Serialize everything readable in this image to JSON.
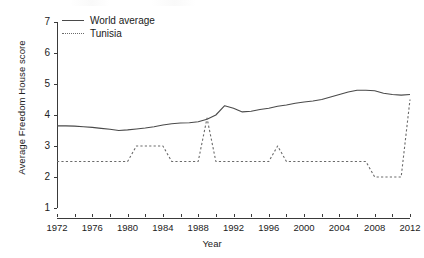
{
  "chart_data": {
    "type": "line",
    "title": "",
    "xlabel": "Year",
    "ylabel": "Average Freedom House score",
    "xlim": [
      1972,
      2012
    ],
    "ylim": [
      1,
      7
    ],
    "grid": false,
    "legend_position": "top-left",
    "x_tick_labels": [
      "1972",
      "1976",
      "1980",
      "1984",
      "1988",
      "1992",
      "1996",
      "2000",
      "2004",
      "2008",
      "2012"
    ],
    "x_tick_values": [
      1972,
      1976,
      1980,
      1984,
      1988,
      1992,
      1996,
      2000,
      2004,
      2008,
      2012
    ],
    "x_minor_tick_values": [
      1974,
      1978,
      1982,
      1986,
      1990,
      1994,
      1998,
      2002,
      2006,
      2010
    ],
    "y_tick_labels": [
      "1",
      "2",
      "3",
      "4",
      "5",
      "6",
      "7"
    ],
    "y_tick_values": [
      1,
      2,
      3,
      4,
      5,
      6,
      7
    ],
    "x": [
      1972,
      1973,
      1974,
      1975,
      1976,
      1977,
      1978,
      1979,
      1980,
      1981,
      1982,
      1983,
      1984,
      1985,
      1986,
      1987,
      1988,
      1989,
      1990,
      1991,
      1992,
      1993,
      1994,
      1995,
      1996,
      1997,
      1998,
      1999,
      2000,
      2001,
      2002,
      2003,
      2004,
      2005,
      2006,
      2007,
      2008,
      2009,
      2010,
      2011,
      2012
    ],
    "series": [
      {
        "name": "World average",
        "style": "solid",
        "color": "#4a4a4a",
        "values": [
          3.65,
          3.65,
          3.64,
          3.62,
          3.6,
          3.57,
          3.54,
          3.5,
          3.52,
          3.55,
          3.58,
          3.62,
          3.68,
          3.72,
          3.74,
          3.75,
          3.78,
          3.86,
          4.0,
          4.3,
          4.22,
          4.1,
          4.12,
          4.18,
          4.22,
          4.28,
          4.32,
          4.38,
          4.42,
          4.45,
          4.5,
          4.58,
          4.66,
          4.74,
          4.8,
          4.8,
          4.78,
          4.7,
          4.66,
          4.64,
          4.66
        ]
      },
      {
        "name": "Tunisia",
        "style": "dashed",
        "color": "#6a6a6a",
        "values": [
          2.5,
          2.5,
          2.5,
          2.5,
          2.5,
          2.5,
          2.5,
          2.5,
          2.5,
          3.0,
          3.0,
          3.0,
          3.0,
          2.5,
          2.5,
          2.5,
          2.5,
          3.9,
          2.5,
          2.5,
          2.5,
          2.5,
          2.5,
          2.5,
          2.5,
          3.0,
          2.5,
          2.5,
          2.5,
          2.5,
          2.5,
          2.5,
          2.5,
          2.5,
          2.5,
          2.5,
          2.0,
          2.0,
          2.0,
          2.0,
          4.5
        ]
      }
    ]
  },
  "legend": {
    "items": [
      {
        "label": "World average",
        "style": "solid"
      },
      {
        "label": "Tunisia",
        "style": "dashed"
      }
    ]
  }
}
